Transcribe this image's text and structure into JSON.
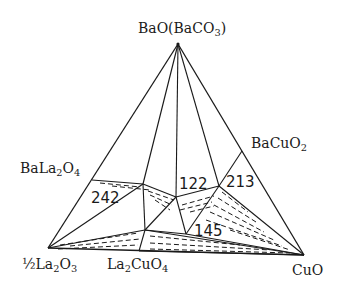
{
  "diagram": {
    "type": "ternary phase diagram",
    "stroke_color": "#1a1a1a",
    "background": "#ffffff",
    "vertices": {
      "top": {
        "label": "BaO(BaCO3)",
        "x": 178,
        "y": 44
      },
      "bottom_left": {
        "label": "½La2O3",
        "x": 48,
        "y": 248
      },
      "bottom_right": {
        "label": "CuO",
        "x": 304,
        "y": 255
      }
    },
    "compounds": [
      {
        "label": "BaLa2O4",
        "x": 92,
        "y": 180
      },
      {
        "label": "BaCuO2",
        "x": 242,
        "y": 151
      },
      {
        "label": "La2CuO4",
        "x": 141,
        "y": 252
      }
    ],
    "phase_points": [
      {
        "label": "242",
        "x": 143,
        "y": 184
      },
      {
        "label": "122",
        "x": 176,
        "y": 197
      },
      {
        "label": "213",
        "x": 219,
        "y": 186
      },
      {
        "label": "145",
        "x": 186,
        "y": 234
      }
    ],
    "labels": {
      "top_main": "BaO(BaCO",
      "top_sub": "3",
      "top_end": ")",
      "bala_a": "BaLa",
      "bala_s1": "2",
      "bala_b": "O",
      "bala_s2": "4",
      "bacu_a": "BaCuO",
      "bacu_s": "2",
      "la2o3_a": "½La",
      "la2o3_s1": "2",
      "la2o3_b": "O",
      "la2o3_s2": "3",
      "la2cu_a": "La",
      "la2cu_s1": "2",
      "la2cu_b": "CuO",
      "la2cu_s2": "4",
      "cuo": "CuO",
      "n242": "242",
      "n122": "122",
      "n213": "213",
      "n145": "145"
    }
  }
}
